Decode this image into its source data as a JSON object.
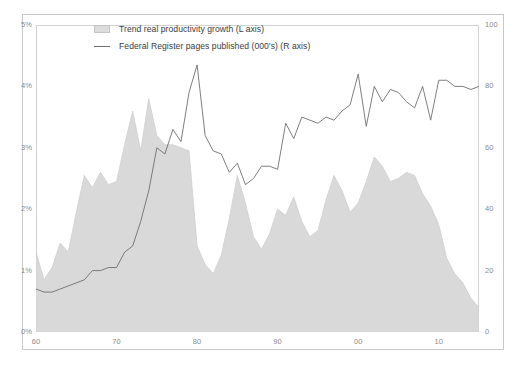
{
  "chart_data": {
    "type": "area",
    "title": "",
    "subtitle": "",
    "xlabel": "",
    "ylabel": "",
    "grid": false,
    "legend_position": "top-center",
    "x": [
      1960,
      1961,
      1962,
      1963,
      1964,
      1965,
      1966,
      1967,
      1968,
      1969,
      1970,
      1971,
      1972,
      1973,
      1974,
      1975,
      1976,
      1977,
      1978,
      1979,
      1980,
      1981,
      1982,
      1983,
      1984,
      1985,
      1986,
      1987,
      1988,
      1989,
      1990,
      1991,
      1992,
      1993,
      1994,
      1995,
      1996,
      1997,
      1998,
      1999,
      2000,
      2001,
      2002,
      2003,
      2004,
      2005,
      2006,
      2007,
      2008,
      2009,
      2010,
      2011,
      2012,
      2013,
      2014,
      2015
    ],
    "x_tick_labels": [
      "60",
      "70",
      "80",
      "90",
      "00",
      "10"
    ],
    "x_tick_values": [
      1960,
      1970,
      1980,
      1990,
      2000,
      2010
    ],
    "xlim": [
      1960,
      2015
    ],
    "ylim_left": [
      0,
      5
    ],
    "ylim_right": [
      0,
      100
    ],
    "y_tick_labels_left": [
      "0%",
      "1%",
      "2%",
      "3%",
      "4%",
      "5%"
    ],
    "y_tick_values_left": [
      0,
      1,
      2,
      3,
      4,
      5
    ],
    "y_tick_labels_right": [
      "0",
      "20",
      "40",
      "60",
      "80",
      "100"
    ],
    "y_tick_values_right": [
      0,
      20,
      40,
      60,
      80,
      100
    ],
    "series": [
      {
        "name": "Trend real productivity growth (L axis)",
        "axis": "left",
        "render": "area",
        "unit": "%",
        "color": "#d9d9d9",
        "edge_color": "#cfcfcf",
        "values": [
          1.3,
          0.85,
          1.05,
          1.45,
          1.3,
          1.95,
          2.55,
          2.35,
          2.6,
          2.4,
          2.45,
          3.05,
          3.6,
          2.95,
          3.8,
          3.2,
          3.05,
          3.05,
          3.0,
          2.95,
          1.4,
          1.1,
          0.95,
          1.25,
          1.85,
          2.55,
          2.1,
          1.55,
          1.35,
          1.6,
          2.0,
          1.9,
          2.2,
          1.8,
          1.55,
          1.65,
          2.15,
          2.55,
          2.3,
          1.95,
          2.1,
          2.45,
          2.85,
          2.7,
          2.45,
          2.5,
          2.6,
          2.55,
          2.25,
          2.05,
          1.75,
          1.2,
          0.95,
          0.8,
          0.55,
          0.4
        ]
      },
      {
        "name": "Federal Register pages published (000's) (R axis)",
        "axis": "right",
        "render": "line",
        "unit": "thousands of pages",
        "color": "#6f6f6f",
        "values": [
          14,
          13,
          13,
          14,
          15,
          16,
          17,
          20,
          20,
          21,
          21,
          26,
          28,
          36,
          46,
          60,
          58,
          66,
          62,
          78,
          87,
          64,
          59,
          58,
          52,
          55,
          48,
          50,
          54,
          54,
          53,
          68,
          63,
          70,
          69,
          68,
          70,
          69,
          72,
          74,
          84,
          67,
          80,
          75,
          79,
          78,
          75,
          73,
          80,
          69,
          82,
          82,
          80,
          80,
          79,
          80
        ]
      }
    ]
  },
  "legend": {
    "items": [
      {
        "label": "Trend real productivity growth (L axis)",
        "marker": "area-swatch"
      },
      {
        "label": "Federal Register pages published (000's) (R axis)",
        "marker": "line-swatch"
      }
    ]
  },
  "colors": {
    "area_fill": "#d9d9d9",
    "line_stroke": "#6f6f6f",
    "axis_text": "#8a8a8a",
    "frame": "#c9c9c9",
    "background": "#ffffff"
  }
}
